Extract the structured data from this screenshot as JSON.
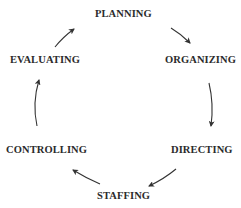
{
  "diagram": {
    "type": "cycle",
    "direction": "clockwise",
    "nodes": [
      {
        "id": "planning",
        "label": "PLANNING"
      },
      {
        "id": "organizing",
        "label": "ORGANIZING"
      },
      {
        "id": "directing",
        "label": "DIRECTING"
      },
      {
        "id": "staffing",
        "label": "STAFFING"
      },
      {
        "id": "controlling",
        "label": "CONTROLLING"
      },
      {
        "id": "evaluating",
        "label": "EVALUATING"
      }
    ],
    "edges": [
      {
        "from": "PLANNING",
        "to": "ORGANIZING"
      },
      {
        "from": "ORGANIZING",
        "to": "DIRECTING"
      },
      {
        "from": "DIRECTING",
        "to": "STAFFING"
      },
      {
        "from": "STAFFING",
        "to": "CONTROLLING"
      },
      {
        "from": "CONTROLLING",
        "to": "EVALUATING"
      },
      {
        "from": "EVALUATING",
        "to": "PLANNING"
      }
    ],
    "colors": {
      "text": "#2b2b2b",
      "arrow": "#333333",
      "background": "#ffffff"
    }
  }
}
